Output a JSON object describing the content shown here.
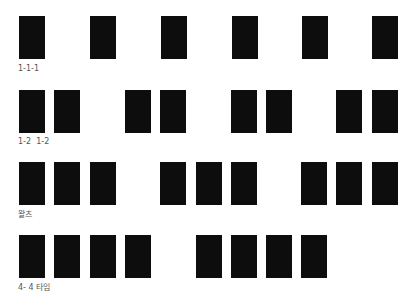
{
  "diagram": {
    "title": "",
    "bar_color": "#0d0d0d",
    "label_color": "#555555",
    "rows": [
      {
        "label": "1-1-1",
        "top": 16,
        "label_top": 64,
        "bars_x": [
          19,
          90,
          161,
          232,
          302,
          372
        ]
      },
      {
        "label": "1-2  1-2",
        "top": 90,
        "label_top": 137,
        "bars_x": [
          19,
          54,
          125,
          160,
          231,
          266,
          336,
          372
        ]
      },
      {
        "label": "왈츠",
        "top": 162,
        "label_top": 210,
        "bars_x": [
          19,
          54,
          90,
          160,
          196,
          231,
          301,
          336,
          372
        ]
      },
      {
        "label": "4- 4 타임",
        "top": 235,
        "label_top": 283,
        "bars_x": [
          19,
          54,
          90,
          125,
          196,
          231,
          266,
          301
        ]
      }
    ]
  }
}
